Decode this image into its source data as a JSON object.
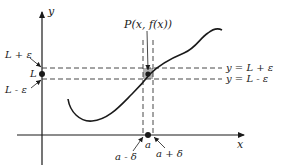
{
  "diagram": {
    "type": "epsilon-delta limit definition illustration",
    "axes": {
      "x_label": "x",
      "y_label": "y"
    },
    "y_marks": {
      "upper": "L + ε",
      "center": "L",
      "lower": "L - ε"
    },
    "x_marks": {
      "left": "a - δ",
      "center": "a",
      "right": "a + δ"
    },
    "point_label": "P(x, f(x))",
    "line_labels": {
      "upper": "y = L + ε",
      "lower": "y = L - ε"
    },
    "colors": {
      "ink": "#1a1a1a",
      "shaded_box": "#9a9a9a",
      "background": "#ffffff"
    }
  }
}
